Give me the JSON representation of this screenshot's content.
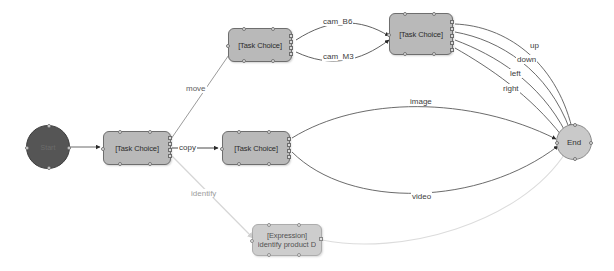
{
  "diagram": {
    "colors": {
      "node_fill": "#b9b9b9",
      "node_stroke": "#6e6e6e",
      "start_fill": "#555555",
      "end_fill": "#c9c9c9",
      "edge_stroke": "#5a5a5a",
      "edge_faded": "#d0d0d0",
      "canvas": "#ffffff"
    },
    "nodes": [
      {
        "id": "start",
        "label": "Start",
        "type": "start-circle"
      },
      {
        "id": "task1",
        "label": "[Task Choice]",
        "type": "task"
      },
      {
        "id": "task2",
        "label": "[Task Choice]",
        "type": "task"
      },
      {
        "id": "task3",
        "label": "[Task Choice]",
        "type": "task"
      },
      {
        "id": "task4",
        "label": "[Task Choice]",
        "type": "task"
      },
      {
        "id": "expr",
        "label": "[Expression]",
        "sublabel": "identify product D",
        "type": "expression"
      },
      {
        "id": "end",
        "label": "End",
        "type": "end-circle"
      }
    ],
    "edges": [
      {
        "id": "e-start-task1",
        "from": "start",
        "to": "task1",
        "label": ""
      },
      {
        "id": "e-task1-task2",
        "from": "task1",
        "to": "task2",
        "label": "move"
      },
      {
        "id": "e-task1-task3",
        "from": "task1",
        "to": "task3",
        "label": "copy"
      },
      {
        "id": "e-task1-expr",
        "from": "task1",
        "to": "expr",
        "label": "identify"
      },
      {
        "id": "e-task2-task4-a",
        "from": "task2",
        "to": "task4",
        "label": "cam_B6"
      },
      {
        "id": "e-task2-task4-b",
        "from": "task2",
        "to": "task4",
        "label": "cam_M3"
      },
      {
        "id": "e-task4-end-up",
        "from": "task4",
        "to": "end",
        "label": "up"
      },
      {
        "id": "e-task4-end-down",
        "from": "task4",
        "to": "end",
        "label": "down"
      },
      {
        "id": "e-task4-end-left",
        "from": "task4",
        "to": "end",
        "label": "left"
      },
      {
        "id": "e-task4-end-right",
        "from": "task4",
        "to": "end",
        "label": "right"
      },
      {
        "id": "e-task3-end-image",
        "from": "task3",
        "to": "end",
        "label": "image"
      },
      {
        "id": "e-task3-end-video",
        "from": "task3",
        "to": "end",
        "label": "video"
      },
      {
        "id": "e-expr-end",
        "from": "expr",
        "to": "end",
        "label": ""
      }
    ]
  }
}
